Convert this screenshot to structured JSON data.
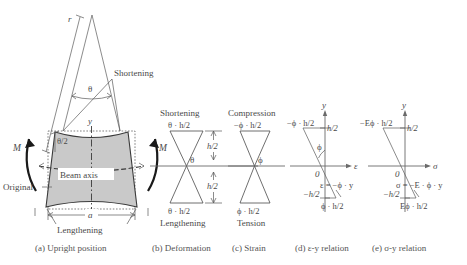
{
  "figure": {
    "background_color": "#ffffff",
    "shade_color": "#c9c9c9",
    "line_color": "#3a3a3a"
  },
  "panel_a": {
    "caption": "(a) Upright position",
    "labels": {
      "radius": "r",
      "theta": "θ",
      "half_theta": "θ/2",
      "shortening": "Shortening",
      "lengthening": "Lengthening",
      "original": "Original",
      "beam_axis": "Beam axis",
      "y_axis": "y",
      "width": "a",
      "moment_left": "M",
      "moment_right": "M"
    }
  },
  "panel_b": {
    "caption": "(b) Deformation",
    "labels": {
      "top_title": "Shortening",
      "top_value": "θ · h/2",
      "bottom_value": "θ · h/2",
      "bottom_title": "Lengthening",
      "angle": "θ",
      "half_height_top": "h/2",
      "half_height_bottom": "h/2"
    }
  },
  "panel_c": {
    "caption": "(c) Strain",
    "labels": {
      "top_title": "Compression",
      "top_value": "−ϕ · h/2",
      "bottom_value": "ϕ · h/2",
      "bottom_title": "Tension",
      "angle": "ϕ"
    }
  },
  "panel_d": {
    "caption": "(d) ε-y relation",
    "labels": {
      "y_axis": "y",
      "x_axis": "ε",
      "origin": "0",
      "top_left_value": "−ϕ · h/2",
      "top_tick": "h/2",
      "bottom_tick": "−h/2",
      "bottom_value": "ϕ · h/2",
      "angle": "ϕ",
      "equation": "ε = −ϕ · y"
    }
  },
  "panel_e": {
    "caption": "(e) σ-y relation",
    "labels": {
      "y_axis": "y",
      "x_axis": "σ",
      "origin": "0",
      "top_left_value": "−Eϕ · h/2",
      "top_tick": "h/2",
      "bottom_tick": "−h/2",
      "bottom_value": "Eϕ · h/2",
      "equation": "σ = −E · ϕ · y"
    }
  }
}
